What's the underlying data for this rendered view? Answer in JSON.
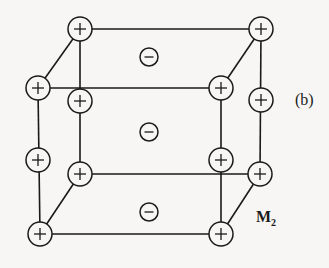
{
  "figure": {
    "panel_label": "(b)",
    "site_label_main": "M",
    "site_label_sub": "2"
  },
  "edges": [
    [
      80,
      29,
      261,
      29
    ],
    [
      38,
      88,
      221,
      88
    ],
    [
      38,
      88,
      80,
      29
    ],
    [
      221,
      88,
      261,
      29
    ],
    [
      80,
      29,
      80,
      174
    ],
    [
      261,
      29,
      260,
      174
    ],
    [
      38,
      88,
      40,
      234
    ],
    [
      221,
      88,
      221,
      234
    ],
    [
      80,
      174,
      260,
      174
    ],
    [
      40,
      234,
      221,
      234
    ],
    [
      40,
      234,
      80,
      174
    ],
    [
      221,
      234,
      260,
      174
    ]
  ],
  "cations": [
    {
      "id": "back-top-left",
      "x": 80,
      "y": 29,
      "charge": "+"
    },
    {
      "id": "back-top-right",
      "x": 261,
      "y": 29,
      "charge": "+"
    },
    {
      "id": "front-top-left",
      "x": 38,
      "y": 88,
      "charge": "+"
    },
    {
      "id": "front-top-right",
      "x": 221,
      "y": 88,
      "charge": "+"
    },
    {
      "id": "back-mid-left",
      "x": 80,
      "y": 101,
      "charge": "+"
    },
    {
      "id": "back-mid-right",
      "x": 261,
      "y": 100,
      "charge": "+"
    },
    {
      "id": "front-mid-left",
      "x": 38,
      "y": 160,
      "charge": "+"
    },
    {
      "id": "front-mid-right",
      "x": 221,
      "y": 160,
      "charge": "+"
    },
    {
      "id": "back-bottom-left",
      "x": 80,
      "y": 174,
      "charge": "+"
    },
    {
      "id": "back-bottom-right",
      "x": 260,
      "y": 174,
      "charge": "+"
    },
    {
      "id": "front-bottom-left",
      "x": 40,
      "y": 234,
      "charge": "+"
    },
    {
      "id": "front-bottom-right",
      "x": 221,
      "y": 234,
      "charge": "+"
    }
  ],
  "anions": [
    {
      "id": "anion-top",
      "x": 149,
      "y": 57,
      "charge": "-"
    },
    {
      "id": "anion-middle",
      "x": 149,
      "y": 132,
      "charge": "-"
    },
    {
      "id": "anion-bottom",
      "x": 149,
      "y": 212,
      "charge": "-"
    }
  ],
  "style": {
    "cation_radius": 12,
    "anion_radius": 9,
    "ink_color": "#1a1a1a",
    "background_color": "#f7f6f4"
  }
}
